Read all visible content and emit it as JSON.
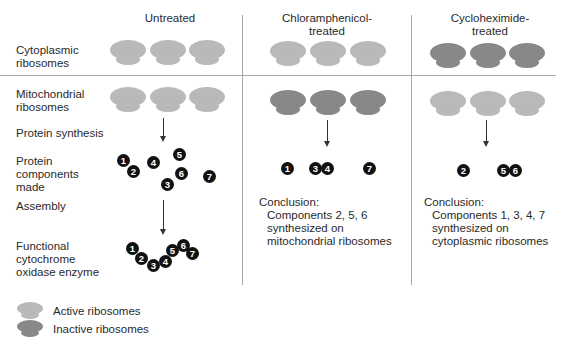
{
  "columns": [
    {
      "id": "untreated",
      "header": "Untreated"
    },
    {
      "id": "chloramphenicol",
      "header_line1": "Chloramphenicol-",
      "header_line2": "treated"
    },
    {
      "id": "cycloheximide",
      "header_line1": "Cycloheximide-",
      "header_line2": "treated"
    }
  ],
  "row_labels": {
    "cytoplasmic": [
      "Cytoplasmic",
      "ribosomes"
    ],
    "mitochondrial": [
      "Mitochondrial",
      "ribosomes"
    ],
    "protein_synthesis": "Protein synthesis",
    "components_made": [
      "Protein",
      "components",
      "made"
    ],
    "assembly": "Assembly",
    "enzyme": [
      "Functional",
      "cytochrome",
      "oxidase enzyme"
    ]
  },
  "ribosome_states": {
    "untreated": {
      "cytoplasmic": "active",
      "mitochondrial": "active"
    },
    "chloramphenicol": {
      "cytoplasmic": "active",
      "mitochondrial": "inactive"
    },
    "cycloheximide": {
      "cytoplasmic": "inactive",
      "mitochondrial": "active"
    }
  },
  "components": {
    "untreated_made": [
      "1",
      "2",
      "3",
      "4",
      "5",
      "6",
      "7"
    ],
    "untreated_assembled": [
      "1",
      "2",
      "3",
      "4",
      "5",
      "6",
      "7"
    ],
    "chloramphenicol_made": [
      "1",
      "3",
      "4",
      "7"
    ],
    "cycloheximide_made": [
      "2",
      "5",
      "6"
    ]
  },
  "conclusions": {
    "chloramphenicol": {
      "title": "Conclusion:",
      "line1": "Components 2, 5, 6",
      "line2": "synthesized on",
      "line3": "mitochondrial ribosomes"
    },
    "cycloheximide": {
      "title": "Conclusion:",
      "line1": "Components 1, 3, 4, 7",
      "line2": "synthesized on",
      "line3": "cytoplasmic ribosomes"
    }
  },
  "legend": {
    "active": "Active ribosomes",
    "inactive": "Inactive ribosomes"
  },
  "colors": {
    "active_ribosome": "#b9b9b9",
    "inactive_ribosome": "#888888",
    "component": "#111111",
    "divider": "#a8a8a8"
  }
}
